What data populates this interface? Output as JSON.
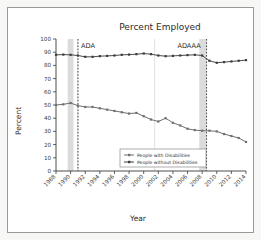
{
  "chart_data": {
    "type": "line",
    "title": "Percent Employed",
    "xlabel": "Year",
    "ylabel": "Percent",
    "ylim": [
      0,
      100
    ],
    "ytick_step": 10,
    "yticks": [
      0,
      10,
      20,
      30,
      40,
      50,
      60,
      70,
      80,
      90,
      100
    ],
    "xlim": [
      1988,
      2014
    ],
    "x": [
      1988,
      1989,
      1990,
      1991,
      1992,
      1993,
      1994,
      1995,
      1996,
      1997,
      1998,
      1999,
      2000,
      2001,
      2002,
      2003,
      2004,
      2005,
      2006,
      2007,
      2008,
      2009,
      2010,
      2011,
      2012,
      2013,
      2014
    ],
    "xticks": [
      1988,
      1990,
      1992,
      1994,
      1996,
      1998,
      2000,
      2002,
      2004,
      2006,
      2008,
      2010,
      2012,
      2014
    ],
    "xticklabels": [
      "1988",
      "1990",
      "1992",
      "1994",
      "1996",
      "1998",
      "2000",
      "2002",
      "2004",
      "2006",
      "2008",
      "2010",
      "2012",
      "2014"
    ],
    "grid": false,
    "legend_position": "bottom-center",
    "series": [
      {
        "name": "People with Disabilities",
        "color": "#6e6e6e",
        "marker": "square",
        "values": [
          50.0,
          50.5,
          51.5,
          49.5,
          48.5,
          48.5,
          47.5,
          46.5,
          45.5,
          44.5,
          43.5,
          44.0,
          41.5,
          39.0,
          37.5,
          40.0,
          36.5,
          34.5,
          32.0,
          31.0,
          30.5,
          30.5,
          30.0,
          28.0,
          26.5,
          25.0,
          22.0
        ]
      },
      {
        "name": "People without Disabilities",
        "color": "#3c3c3c",
        "marker": "square",
        "values": [
          88.0,
          88.2,
          88.0,
          87.5,
          86.5,
          86.5,
          87.0,
          87.2,
          87.5,
          88.0,
          88.2,
          88.5,
          89.0,
          88.5,
          87.5,
          87.0,
          87.2,
          87.5,
          87.8,
          88.0,
          87.5,
          83.5,
          82.0,
          82.5,
          83.0,
          83.5,
          84.0
        ]
      }
    ],
    "annotations": [
      {
        "label": "ADA",
        "x": 1991.0,
        "line_x": 1991.0,
        "style": "dashed-vline"
      },
      {
        "label": "ADAAA",
        "x": 2007.4,
        "line_x": 2008.6,
        "style": "dashed-vline"
      }
    ],
    "shaded_bands": [
      {
        "name": "recession-band-1990",
        "x0": 1989.6,
        "x1": 1990.4
      },
      {
        "name": "recession-band-2008",
        "x0": 2007.6,
        "x1": 2008.6
      }
    ]
  }
}
